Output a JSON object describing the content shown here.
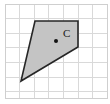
{
  "figure": {
    "canvas": {
      "width": 110,
      "height": 104,
      "background": "#ffffff"
    },
    "grid": {
      "line_color": "#d9d9d9",
      "border_color": "#cccccc",
      "line_width": 1,
      "cell_size": 14.6,
      "origin_x": 5,
      "origin_y": 4,
      "columns": 7,
      "rows": 6.5,
      "x_positions": [
        5,
        19.6,
        34.2,
        48.8,
        63.4,
        78,
        92.6,
        107.2
      ],
      "y_positions": [
        4,
        18.6,
        33.2,
        47.8,
        62.4,
        77,
        91.6,
        98
      ]
    },
    "shapes": [
      {
        "name": "quadrilateral",
        "type": "polygon",
        "points": "35,21 78,21 78,47 21,81",
        "vertices": [
          {
            "x": 35,
            "y": 21
          },
          {
            "x": 78,
            "y": 21
          },
          {
            "x": 78,
            "y": 47
          },
          {
            "x": 21,
            "y": 81
          }
        ],
        "fill": "#c4c4c4",
        "stroke": "#262626",
        "stroke_width": 1.6
      }
    ],
    "points": [
      {
        "name": "center-point",
        "label": "C",
        "x": 56,
        "y": 41,
        "radius": 2,
        "color": "#141414",
        "label_x": 63,
        "label_y": 37
      }
    ]
  }
}
